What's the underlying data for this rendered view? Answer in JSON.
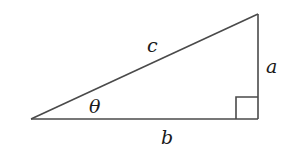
{
  "diagram": {
    "type": "right-triangle",
    "colors": {
      "stroke": "#4a4a4a",
      "text": "#1a1a1a",
      "background": "#ffffff"
    },
    "vertices": {
      "left": [
        31,
        119
      ],
      "bottom_right": [
        258,
        119
      ],
      "top_right": [
        258,
        14
      ]
    },
    "labels": {
      "hypotenuse": "c",
      "opposite": "a",
      "adjacent": "b",
      "angle": "θ"
    },
    "right_angle_marker": {
      "corner": "bottom_right",
      "size": 22
    }
  }
}
